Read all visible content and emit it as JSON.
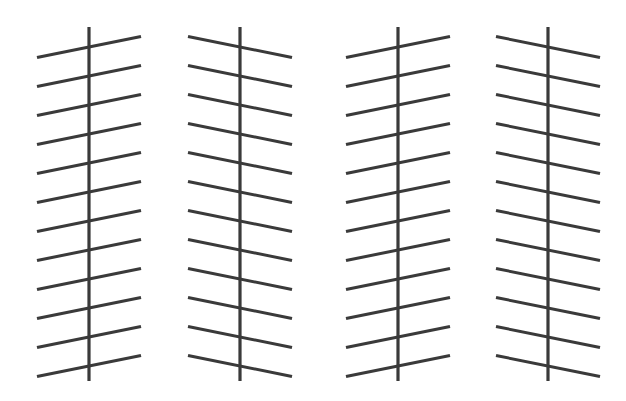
{
  "figure": {
    "canvas": {
      "width": 626,
      "height": 401,
      "background": "#ffffff"
    },
    "line_color": "#3a3a3a",
    "vertical_line_width": 3.2,
    "diagonal_line_width": 3.0,
    "vertical_top_y": 27,
    "vertical_bottom_y": 381,
    "diagonal_count_per_group": 12,
    "diagonal_half_length_x": 52,
    "diagonal_vertical_spacing": 29,
    "diagonal_first_center_y": 47,
    "diagonal_rise": 21,
    "groups": [
      {
        "name": "group-1",
        "center_x": 89,
        "slope": "up-right",
        "direction": 1
      },
      {
        "name": "group-2",
        "center_x": 240,
        "slope": "down-right",
        "direction": -1
      },
      {
        "name": "group-3",
        "center_x": 398,
        "slope": "up-right",
        "direction": 1
      },
      {
        "name": "group-4",
        "center_x": 548,
        "slope": "down-right",
        "direction": -1
      }
    ]
  }
}
